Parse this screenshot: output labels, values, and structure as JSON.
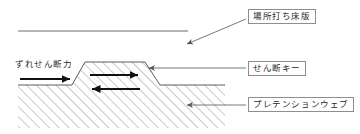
{
  "diagram": {
    "colors": {
      "outline": "#4a4a4a",
      "hatch": "#8a8a8a",
      "arrow": "#111111",
      "leader": "#555555",
      "box_border": "#8e8e8e",
      "text": "#262626",
      "background": "#ffffff"
    },
    "labels": {
      "cast_in_place_slab": "場所打ち床版",
      "shear_key": "せん断キー",
      "pretension_web": "プレテンションウェブ",
      "shear_force": "ずれせん断力"
    },
    "icons": {
      "leader_arrow": "arrow-head",
      "force_arrow": "bold-arrow-right",
      "reaction_arrow_right": "bold-arrow-right",
      "reaction_arrow_left": "bold-arrow-left"
    },
    "geometry": {
      "slab_line_y": 31,
      "body_top_y": 85,
      "body_bottom_y": 128,
      "body_left_x": 18,
      "body_right_x": 225,
      "key_top_y": 62,
      "key_top_left_x": 85,
      "key_top_right_x": 145,
      "key_base_left_x": 72,
      "key_base_right_x": 160
    }
  }
}
